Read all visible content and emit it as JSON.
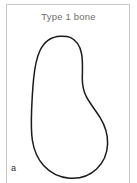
{
  "figure": {
    "title": "Type 1 bone",
    "panel_letter": "a",
    "frame_color": "#c9c9c9",
    "title_color": "#6e6e6e",
    "background_color": "#ffffff"
  },
  "diagram": {
    "name": "bone-cross-section-outline",
    "outline_color": "#1a1a1a",
    "outline_width": 1.5,
    "fill_color": "#ffffff",
    "stipple": {
      "name": "trabecular-stipple-pattern",
      "dot_color": "#cfcfcf",
      "dot_radius": 0.85,
      "description": "Faint stippled dots representing trabecular bone, sparse near the top and dense in the lower-middle region",
      "points": [
        [
          62,
          57
        ],
        [
          66,
          59
        ],
        [
          59,
          62
        ],
        [
          64,
          64
        ],
        [
          68,
          63
        ],
        [
          61,
          67
        ],
        [
          65,
          69
        ],
        [
          58,
          70
        ],
        [
          69,
          71
        ],
        [
          63,
          73
        ],
        [
          67,
          75
        ],
        [
          60,
          76
        ],
        [
          64,
          78
        ],
        [
          70,
          78
        ],
        [
          57,
          80
        ],
        [
          62,
          82
        ],
        [
          66,
          83
        ],
        [
          71,
          84
        ],
        [
          59,
          85
        ],
        [
          64,
          87
        ],
        [
          68,
          88
        ],
        [
          56,
          89
        ],
        [
          61,
          91
        ],
        [
          66,
          92
        ],
        [
          72,
          92
        ],
        [
          58,
          94
        ],
        [
          63,
          95
        ],
        [
          69,
          96
        ],
        [
          55,
          97
        ],
        [
          60,
          99
        ],
        [
          65,
          100
        ],
        [
          71,
          101
        ],
        [
          75,
          101
        ],
        [
          57,
          102
        ],
        [
          62,
          104
        ],
        [
          67,
          105
        ],
        [
          73,
          105
        ],
        [
          54,
          106
        ],
        [
          59,
          108
        ],
        [
          64,
          109
        ],
        [
          69,
          110
        ],
        [
          76,
          110
        ],
        [
          56,
          111
        ],
        [
          61,
          113
        ],
        [
          66,
          114
        ],
        [
          72,
          114
        ],
        [
          78,
          115
        ],
        [
          53,
          116
        ],
        [
          58,
          117
        ],
        [
          63,
          118
        ],
        [
          68,
          119
        ],
        [
          74,
          119
        ],
        [
          80,
          120
        ],
        [
          55,
          121
        ],
        [
          60,
          122
        ],
        [
          65,
          123
        ],
        [
          70,
          124
        ],
        [
          76,
          124
        ],
        [
          82,
          125
        ],
        [
          52,
          126
        ],
        [
          57,
          127
        ],
        [
          62,
          128
        ],
        [
          67,
          129
        ],
        [
          73,
          129
        ],
        [
          79,
          130
        ],
        [
          84,
          130
        ],
        [
          54,
          131
        ],
        [
          59,
          132
        ],
        [
          64,
          133
        ],
        [
          69,
          134
        ],
        [
          75,
          134
        ],
        [
          81,
          135
        ],
        [
          56,
          136
        ],
        [
          61,
          137
        ],
        [
          66,
          138
        ],
        [
          71,
          139
        ],
        [
          77,
          139
        ],
        [
          83,
          140
        ],
        [
          58,
          141
        ],
        [
          63,
          142
        ],
        [
          68,
          143
        ],
        [
          74,
          143
        ],
        [
          80,
          144
        ],
        [
          60,
          146
        ],
        [
          65,
          147
        ],
        [
          70,
          148
        ],
        [
          76,
          148
        ],
        [
          62,
          150
        ],
        [
          67,
          151
        ],
        [
          72,
          152
        ],
        [
          64,
          154
        ],
        [
          69,
          155
        ],
        [
          66,
          157
        ],
        [
          71,
          158
        ]
      ]
    }
  }
}
